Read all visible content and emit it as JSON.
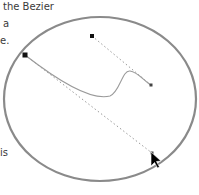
{
  "text": {
    "line1": "the Bezier",
    "line2": "a",
    "line3": "e.",
    "line4": "is"
  },
  "colors": {
    "ellipse_stroke": "#8a8a8a",
    "curve_stroke": "#9a9a9a",
    "handle_stroke": "#9a9a9a",
    "anchor_fill": "#111111",
    "cursor_fill": "#000000"
  },
  "drawing": {
    "ellipse": {
      "cx": 100,
      "cy": 99,
      "rx": 96,
      "ry": 82
    },
    "bezier": {
      "start": [
        25,
        55
      ],
      "control1": [
        152,
        153
      ],
      "control2": [
        92,
        36
      ],
      "end": [
        151,
        85
      ]
    }
  }
}
